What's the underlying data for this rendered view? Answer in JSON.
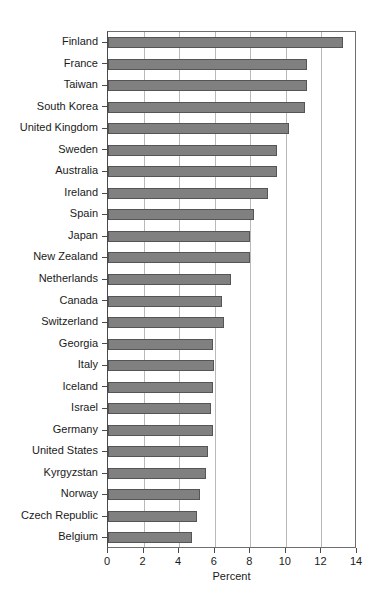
{
  "chart_data": {
    "type": "bar",
    "orientation": "horizontal",
    "title": "",
    "xlabel": "Percent",
    "ylabel": "",
    "xlim": [
      0,
      14
    ],
    "xticks": [
      0,
      2,
      4,
      6,
      8,
      10,
      12,
      14
    ],
    "xtick_labels": [
      "0",
      "2",
      "4",
      "6",
      "8",
      "10",
      "12",
      "14"
    ],
    "grid": "vertical",
    "legend": "none",
    "bar_color": "#808080",
    "bar_edge_color": "#555555",
    "categories": [
      "Finland",
      "France",
      "Taiwan",
      "South Korea",
      "United Kingdom",
      "Sweden",
      "Australia",
      "Ireland",
      "Spain",
      "Japan",
      "New Zealand",
      "Netherlands",
      "Canada",
      "Switzerland",
      "Georgia",
      "Italy",
      "Iceland",
      "Israel",
      "Germany",
      "United States",
      "Kyrgyzstan",
      "Norway",
      "Czech Republic",
      "Belgium"
    ],
    "values": [
      13.2,
      11.2,
      11.2,
      11.1,
      10.2,
      9.5,
      9.5,
      9.0,
      8.2,
      8.0,
      8.0,
      6.9,
      6.4,
      6.5,
      5.9,
      5.95,
      5.9,
      5.8,
      5.9,
      5.65,
      5.5,
      5.2,
      5.0,
      4.7
    ]
  }
}
